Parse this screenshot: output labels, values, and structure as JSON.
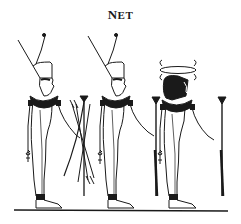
{
  "title": {
    "first": "N",
    "rest": "ET"
  },
  "figures": [
    {
      "name": "figure-red-crown-bow-arrows",
      "crown": "red-crown",
      "holds_right": "bow-and-arrows",
      "holds_left": "ankh"
    },
    {
      "name": "figure-red-crown-scepter",
      "crown": "red-crown",
      "holds_right": "was-scepter",
      "holds_left": "ankh"
    },
    {
      "name": "figure-shield-headdress-scepter",
      "crown": "crossed-bows-emblem",
      "holds_right": "was-scepter",
      "holds_left": "ankh"
    }
  ],
  "colors": {
    "ink": "#1a1a1a",
    "background": "#ffffff"
  }
}
